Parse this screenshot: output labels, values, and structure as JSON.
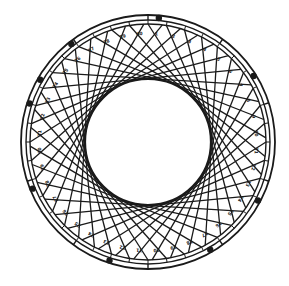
{
  "diagram": {
    "type": "circular-lattice",
    "center": [
      148,
      142
    ],
    "outer_ring_outer_r": 127,
    "outer_ring_inner_r": 122,
    "lattice_outer_r": 118,
    "inner_void_r": 63,
    "divisions": 40,
    "chord_span_deg": 115,
    "stroke_color": "#1a1a1a",
    "background_color": "#ffffff",
    "ring_tick_angles_deg": [
      0,
      36,
      72,
      108,
      144,
      180,
      216,
      252,
      288,
      324
    ],
    "ring_blob_angles_deg": [
      -72,
      -38,
      5,
      58,
      118,
      150,
      198,
      248,
      300
    ],
    "cell_labels": [
      "1",
      "2",
      "3",
      "4",
      "5",
      "6",
      "7",
      "8",
      "9",
      "10",
      "11",
      "12",
      "13",
      "14",
      "15",
      "16",
      "17",
      "18",
      "19",
      "20",
      "21",
      "22",
      "23",
      "24",
      "25",
      "26",
      "27",
      "28",
      "29",
      "30",
      "31",
      "32",
      "33",
      "34",
      "35",
      "36",
      "37",
      "38",
      "39",
      "40"
    ]
  }
}
